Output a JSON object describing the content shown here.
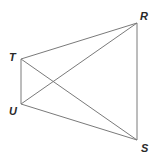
{
  "diagram": {
    "type": "geometry-figure",
    "points": [
      {
        "name": "T",
        "x": 21,
        "y": 59,
        "label_x": 9,
        "label_y": 61
      },
      {
        "name": "R",
        "x": 137,
        "y": 23,
        "label_x": 140,
        "label_y": 20
      },
      {
        "name": "U",
        "x": 21,
        "y": 104,
        "label_x": 9,
        "label_y": 115
      },
      {
        "name": "S",
        "x": 137,
        "y": 140,
        "label_x": 141,
        "label_y": 152
      }
    ],
    "segments": [
      [
        "T",
        "R"
      ],
      [
        "T",
        "U"
      ],
      [
        "T",
        "S"
      ],
      [
        "U",
        "R"
      ],
      [
        "U",
        "S"
      ],
      [
        "R",
        "S"
      ]
    ],
    "line_color": "#7a7a7a",
    "label_color": "#2a2a2a"
  },
  "labels": {
    "T": "T",
    "R": "R",
    "U": "U",
    "S": "S"
  }
}
